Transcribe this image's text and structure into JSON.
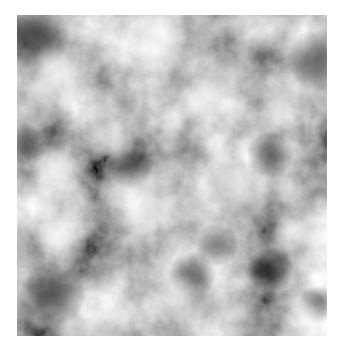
{
  "image": {
    "kind": "grayscale cloud noise texture",
    "background_color": "#ffffff",
    "base_gray": "#8e8e8e",
    "bounds": {
      "x": 17,
      "y": 15,
      "width": 310,
      "height": 321
    },
    "highlights": [
      {
        "x": 43,
        "y": 60,
        "r": 30,
        "color": "#e4e4e4"
      },
      {
        "x": 221,
        "y": 175,
        "r": 22,
        "color": "#f4f4f4"
      },
      {
        "x": 45,
        "y": 225,
        "r": 22,
        "color": "#e8e8e8"
      },
      {
        "x": 138,
        "y": 15,
        "r": 28,
        "color": "#d6d6d6"
      },
      {
        "x": 123,
        "y": 185,
        "r": 30,
        "color": "#cfcfcf"
      },
      {
        "x": 263,
        "y": 95,
        "r": 20,
        "color": "#d8d8d8"
      },
      {
        "x": 40,
        "y": 160,
        "r": 22,
        "color": "#cccccc"
      },
      {
        "x": 190,
        "y": 80,
        "r": 24,
        "color": "#c8c8c8"
      },
      {
        "x": 160,
        "y": 290,
        "r": 30,
        "color": "#cdcdcd"
      },
      {
        "x": 290,
        "y": 300,
        "r": 18,
        "color": "#d0d0d0"
      },
      {
        "x": 95,
        "y": 130,
        "r": 20,
        "color": "#c4c4c4"
      },
      {
        "x": 280,
        "y": 220,
        "r": 22,
        "color": "#c8c8c8"
      }
    ],
    "shadows": [
      {
        "x": 18,
        "y": 20,
        "r": 30,
        "color": "#3c3c3c"
      },
      {
        "x": 300,
        "y": 45,
        "r": 26,
        "color": "#3a3a3a"
      },
      {
        "x": 253,
        "y": 140,
        "r": 20,
        "color": "#4a4a4a"
      },
      {
        "x": 253,
        "y": 255,
        "r": 20,
        "color": "#3e3e3e"
      },
      {
        "x": 35,
        "y": 280,
        "r": 28,
        "color": "#4c4c4c"
      },
      {
        "x": 113,
        "y": 150,
        "r": 20,
        "color": "#555555"
      },
      {
        "x": 175,
        "y": 260,
        "r": 20,
        "color": "#5a5a5a"
      },
      {
        "x": 300,
        "y": 290,
        "r": 16,
        "color": "#4a4a4a"
      },
      {
        "x": 200,
        "y": 230,
        "r": 18,
        "color": "#5c5c5c"
      },
      {
        "x": 8,
        "y": 130,
        "r": 18,
        "color": "#4e4e4e"
      }
    ]
  }
}
